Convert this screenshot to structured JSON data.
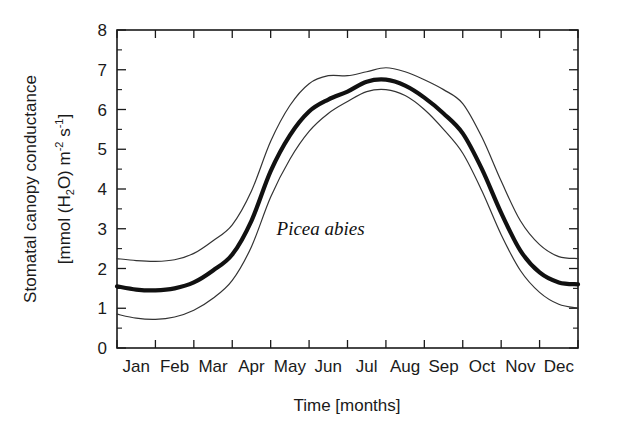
{
  "figure": {
    "background_color": "#ffffff",
    "line_color": "#111111",
    "annotation": "Picea abies"
  },
  "axes": {
    "x_title": "Time [months]",
    "y_title_line1": "Stomatal canopy conductance",
    "y_title_line2_prefix": "[mmol (H",
    "y_title_line2_sub": "2",
    "y_title_line2_mid": "O) m",
    "y_title_line2_sup1": "-2",
    "y_title_line2_mid2": " s",
    "y_title_line2_sup2": "-1",
    "y_title_line2_suffix": "]"
  },
  "chart_data": {
    "type": "line",
    "title": "",
    "xlabel": "Time [months]",
    "ylabel": "Stomatal canopy conductance [mmol (H2O) m-2 s-1]",
    "categories": [
      "Jan",
      "Feb",
      "Mar",
      "Apr",
      "May",
      "Jun",
      "Jul",
      "Aug",
      "Sep",
      "Oct",
      "Nov",
      "Dec"
    ],
    "x_tick_labels": [
      "Jan",
      "Feb",
      "Mar",
      "Apr",
      "May",
      "Jun",
      "Jul",
      "Aug",
      "Sep",
      "Oct",
      "Nov",
      "Dec"
    ],
    "y_tick_labels": [
      "0",
      "1",
      "2",
      "3",
      "4",
      "5",
      "6",
      "7",
      "8"
    ],
    "y_ticks": [
      0,
      1,
      2,
      3,
      4,
      5,
      6,
      7,
      8
    ],
    "y_minor_ticks": [
      0.5,
      1.5,
      2.5,
      3.5,
      4.5,
      5.5,
      6.5,
      7.5
    ],
    "ylim": [
      0,
      8
    ],
    "xlim": [
      0,
      12
    ],
    "grid": false,
    "legend": "none",
    "annotations": [
      {
        "text": "Picea abies",
        "x": 5.3,
        "y": 2.85,
        "style": "italic-serif"
      }
    ],
    "series": [
      {
        "name": "mean canopy conductance",
        "style": "thick",
        "x": [
          0.0,
          0.5,
          1.0,
          1.5,
          2.0,
          2.5,
          3.0,
          3.5,
          4.0,
          4.5,
          5.0,
          5.5,
          6.0,
          6.5,
          7.0,
          7.5,
          8.0,
          8.5,
          9.0,
          9.5,
          10.0,
          10.5,
          11.0,
          11.5,
          12.0
        ],
        "values": [
          1.55,
          1.47,
          1.45,
          1.5,
          1.65,
          1.95,
          2.35,
          3.2,
          4.45,
          5.35,
          5.95,
          6.25,
          6.45,
          6.7,
          6.75,
          6.6,
          6.3,
          5.9,
          5.4,
          4.5,
          3.4,
          2.45,
          1.9,
          1.65,
          1.6
        ]
      },
      {
        "name": "upper bound",
        "style": "thin",
        "x": [
          0.0,
          0.5,
          1.0,
          1.5,
          2.0,
          2.5,
          3.0,
          3.5,
          4.0,
          4.5,
          5.0,
          5.5,
          6.0,
          6.5,
          7.0,
          7.5,
          8.0,
          8.5,
          9.0,
          9.5,
          10.0,
          10.5,
          11.0,
          11.5,
          12.0
        ],
        "values": [
          2.25,
          2.2,
          2.18,
          2.22,
          2.38,
          2.7,
          3.1,
          3.95,
          5.2,
          6.1,
          6.65,
          6.85,
          6.85,
          6.95,
          7.05,
          6.95,
          6.75,
          6.5,
          6.15,
          5.3,
          4.2,
          3.2,
          2.6,
          2.3,
          2.25
        ]
      },
      {
        "name": "lower bound",
        "style": "thin",
        "x": [
          0.0,
          0.5,
          1.0,
          1.5,
          2.0,
          2.5,
          3.0,
          3.5,
          4.0,
          4.5,
          5.0,
          5.5,
          6.0,
          6.5,
          7.0,
          7.5,
          8.0,
          8.5,
          9.0,
          9.5,
          10.0,
          10.5,
          11.0,
          11.5,
          12.0
        ],
        "values": [
          0.85,
          0.75,
          0.72,
          0.78,
          0.95,
          1.25,
          1.7,
          2.55,
          3.8,
          4.75,
          5.45,
          5.9,
          6.2,
          6.45,
          6.5,
          6.35,
          6.0,
          5.5,
          4.9,
          3.95,
          2.85,
          1.95,
          1.4,
          1.1,
          1.0
        ]
      }
    ]
  }
}
